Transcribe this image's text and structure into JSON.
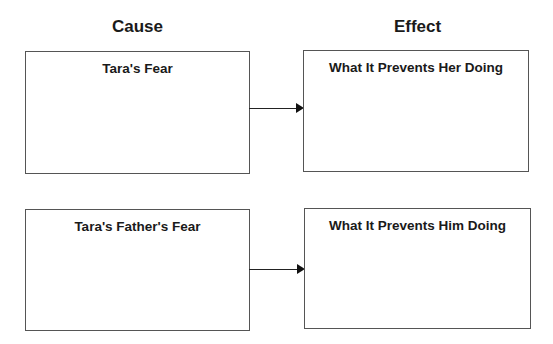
{
  "headings": {
    "cause": "Cause",
    "effect": "Effect"
  },
  "rows": [
    {
      "cause_box": {
        "title": "Tara's Fear"
      },
      "effect_box": {
        "title": "What It Prevents Her Doing"
      },
      "connector": "arrow-right"
    },
    {
      "cause_box": {
        "title": "Tara's Father's Fear"
      },
      "effect_box": {
        "title": "What It Prevents Him Doing"
      },
      "connector": "arrow-right"
    }
  ],
  "colors": {
    "border": "#555555",
    "arrow": "#222222",
    "text": "#1a1a1a"
  }
}
